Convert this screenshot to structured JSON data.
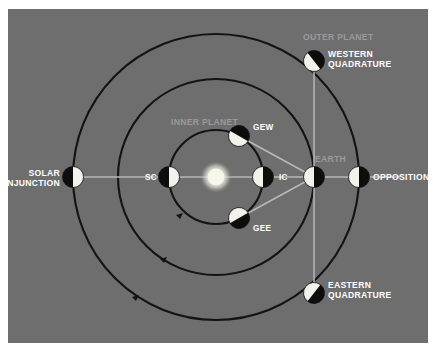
{
  "figure": {
    "type": "astronomy-orbital-configuration-diagram",
    "background_color": "#6e6e6e",
    "orbit_color": "#141414",
    "sightline_color": "#b9b9b9",
    "label_white": "#ffffff",
    "label_grey": "#9a9a9a",
    "sun_color": "#f0efe6"
  },
  "center_body": {
    "name": "sun",
    "label": ""
  },
  "orbit_labels": {
    "inner": "INNER PLANET",
    "outer": "OUTER PLANET",
    "earth": "EARTH"
  },
  "positions": [
    {
      "id": "solar-conjunction",
      "label": "SOLAR\nCONJUNCTION",
      "style": "white",
      "align": "right"
    },
    {
      "id": "opposition",
      "label": "OPPOSITION",
      "style": "white",
      "align": "left"
    },
    {
      "id": "western-quadrature",
      "label": "WESTERN\nQUADRATURE",
      "style": "white",
      "align": "left"
    },
    {
      "id": "eastern-quadrature",
      "label": "EASTERN\nQUADRATURE",
      "style": "white",
      "align": "left"
    },
    {
      "id": "superior-conjunction",
      "label": "SC",
      "style": "white",
      "align": "left"
    },
    {
      "id": "inferior-conjunction",
      "label": "IC",
      "style": "white",
      "align": "left"
    },
    {
      "id": "greatest-eastern-elongation",
      "label": "GEE",
      "style": "white",
      "align": "left"
    },
    {
      "id": "greatest-western-elongation",
      "label": "GEW",
      "style": "white",
      "align": "left"
    }
  ]
}
